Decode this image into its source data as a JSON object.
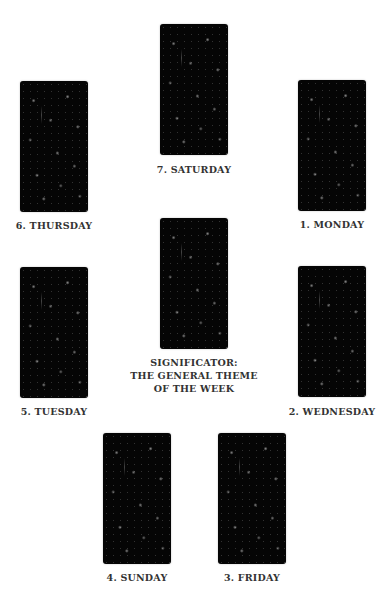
{
  "spread": {
    "cards": [
      {
        "position": 1,
        "label": "1. MONDAY"
      },
      {
        "position": 2,
        "label": "2. WEDNESDAY"
      },
      {
        "position": 3,
        "label": "3. FRIDAY"
      },
      {
        "position": 4,
        "label": "4. SUNDAY"
      },
      {
        "position": 5,
        "label": "5. TUESDAY"
      },
      {
        "position": 6,
        "label": "6. THURSDAY"
      },
      {
        "position": 7,
        "label": "7. SATURDAY"
      }
    ],
    "significator": {
      "line1": "SIGNIFICATOR:",
      "line2": "THE GENERAL THEME",
      "line3": "OF THE WEEK"
    }
  },
  "colors": {
    "card_back": "#050505",
    "label_text": "#333333",
    "background": "#ffffff"
  }
}
